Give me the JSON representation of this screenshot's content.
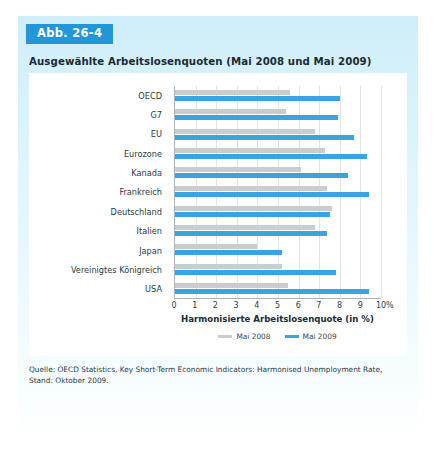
{
  "figure": {
    "badge": "Abb. 26-4",
    "title": "Ausgewählte Arbeitslosenquoten (Mai 2008 und Mai 2009)",
    "source": "Quelle: OECD Statistics, Key Short-Term Economic Indicators: Harmonised Unemployment Rate, Stand: Oktober 2009.",
    "badge_color": "#2196d9",
    "panel_color": "#d9f2fb"
  },
  "chart_data": {
    "type": "bar",
    "orientation": "horizontal",
    "title": "Ausgewählte Arbeitslosenquoten (Mai 2008 und Mai 2009)",
    "xlabel": "Harmonisierte Arbeitslosenquote (in %)",
    "ylabel": "",
    "xunit": "%",
    "xlim": [
      0,
      10
    ],
    "xticks": [
      0,
      1,
      2,
      3,
      4,
      5,
      6,
      7,
      8,
      9,
      10
    ],
    "xtick_labels": [
      "0",
      "1",
      "2",
      "3",
      "4",
      "5",
      "6",
      "7",
      "8",
      "9",
      "10"
    ],
    "grid": true,
    "grid_axis": "x",
    "legend_position": "bottom-center",
    "categories": [
      "OECD",
      "G7",
      "EU",
      "Eurozone",
      "Kanada",
      "Frankreich",
      "Deutschland",
      "Italien",
      "Japan",
      "Vereinigtes Königreich",
      "USA"
    ],
    "series": [
      {
        "name": "Mai 2008",
        "color": "#c9cdcf",
        "values": [
          5.6,
          5.4,
          6.8,
          7.3,
          6.1,
          7.4,
          7.6,
          6.8,
          4.0,
          5.2,
          5.5
        ]
      },
      {
        "name": "Mai 2009",
        "color": "#3aa3e0",
        "values": [
          8.0,
          7.9,
          8.7,
          9.3,
          8.4,
          9.4,
          7.5,
          7.4,
          5.2,
          7.8,
          9.4
        ]
      }
    ]
  }
}
